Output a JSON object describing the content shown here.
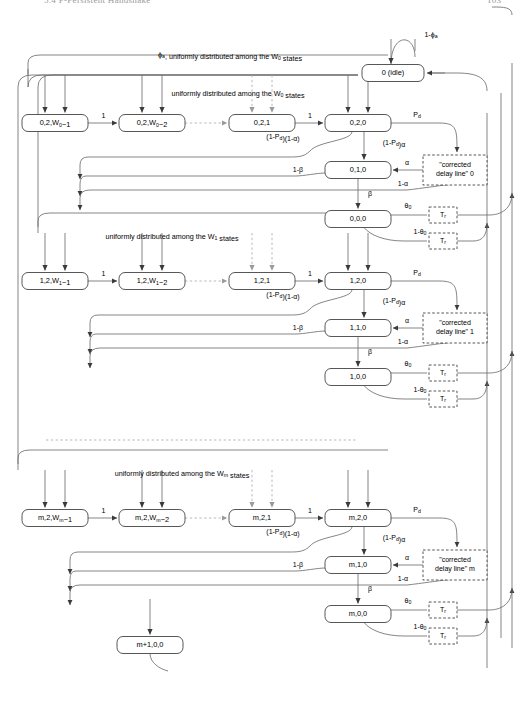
{
  "page": {
    "header_title": "5.4  P-Persistent Handshake",
    "header_page": "103"
  },
  "diagram": {
    "type": "markov-chain-state-transition-diagram",
    "idle_node": {
      "label": "0 (idle)",
      "self_loop_label": "1-ϕₐ"
    },
    "captions": [
      {
        "id": "phi-uniform-w0",
        "text": "ϕₐ, uniformly distributed among the W₀ states"
      },
      {
        "id": "uniform-w0",
        "text": "uniformly distributed among the W₀ states"
      },
      {
        "id": "uniform-w1",
        "text": "uniformly distributed among the W₁ states"
      },
      {
        "id": "uniform-wm",
        "text": "uniformly distributed among the Wₘ states"
      }
    ],
    "rows": [
      {
        "id": "row-0",
        "index": "0",
        "backoff_nodes": [
          "0,2,W₀−1",
          "0,2,W₀−2",
          "0,2,1",
          "0,2,0"
        ],
        "backoff_edge_labels": [
          "1",
          "1"
        ],
        "sense_node": "0,1,0",
        "final_node": "0,0,0",
        "delay_line": "\"corrected delay line\" 0",
        "timer_boxes": [
          "Tᵣ",
          "Tᵣ"
        ],
        "edge_labels": {
          "defer": "(1-Pᵈ)(1-α)",
          "attempt": "(1-Pᵈ)α",
          "drop": "Pᵈ",
          "alpha": "α",
          "one_minus_alpha": "1-α",
          "beta": "β",
          "one_minus_beta": "1-β",
          "theta": "θ₀",
          "one_minus_theta": "1-θ₀"
        }
      },
      {
        "id": "row-1",
        "index": "1",
        "backoff_nodes": [
          "1,2,W₁−1",
          "1,2,W₁−2",
          "1,2,1",
          "1,2,0"
        ],
        "backoff_edge_labels": [
          "1",
          "1"
        ],
        "sense_node": "1,1,0",
        "final_node": "1,0,0",
        "delay_line": "\"corrected delay line\" 1",
        "timer_boxes": [
          "Tᵣ",
          "Tᵣ"
        ],
        "edge_labels": {
          "defer": "(1-Pᵈ)(1-α)",
          "attempt": "(1-Pᵈ)α",
          "drop": "Pᵈ",
          "alpha": "α",
          "one_minus_alpha": "1-α",
          "beta": "β",
          "one_minus_beta": "1-β",
          "theta": "θ₀",
          "one_minus_theta": "1-θ₀"
        }
      },
      {
        "id": "row-m",
        "index": "m",
        "backoff_nodes": [
          "m,2,Wₘ−1",
          "m,2,Wₘ−2",
          "m,2,1",
          "m,2,0"
        ],
        "backoff_edge_labels": [
          "1",
          "1"
        ],
        "sense_node": "m,1,0",
        "final_node": "m,0,0",
        "overflow_node": "m+1,0,0",
        "delay_line": "\"corrected delay line\" m",
        "timer_boxes": [
          "Tᵣ",
          "Tᵣ"
        ],
        "edge_labels": {
          "defer": "(1-Pᵈ)(1-α)",
          "attempt": "(1-Pᵈ)α",
          "drop": "Pᵈ",
          "alpha": "α",
          "one_minus_alpha": "1-α",
          "beta": "β",
          "one_minus_beta": "1-β",
          "theta": "θ₀",
          "one_minus_theta": "1-θ₀"
        }
      }
    ],
    "colors": {
      "stroke": "#6f6f6f",
      "node_stroke": "#444444",
      "text": "#000000",
      "background": "#ffffff"
    }
  }
}
